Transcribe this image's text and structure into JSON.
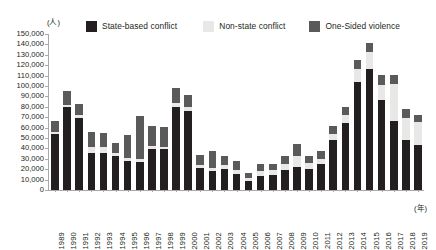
{
  "chart_data": {
    "type": "bar",
    "stacked": true,
    "title": "",
    "xlabel": "(年)",
    "ylabel": "(人)",
    "ylim": [
      0,
      150000
    ],
    "ytick_step": 10000,
    "grid": false,
    "legend_position": "top",
    "categories": [
      "1989",
      "1990",
      "1991",
      "1992",
      "1993",
      "1994",
      "1995",
      "1996",
      "1997",
      "1998",
      "1999",
      "2000",
      "2001",
      "2002",
      "2003",
      "2004",
      "2005",
      "2006",
      "2007",
      "2008",
      "2009",
      "2010",
      "2011",
      "2012",
      "2013",
      "2014",
      "2015",
      "2016",
      "2017",
      "2018",
      "2019"
    ],
    "ytick_labels": [
      "0",
      "10,000",
      "20,000",
      "30,000",
      "40,000",
      "50,000",
      "60,000",
      "70,000",
      "80,000",
      "90,000",
      "100,000",
      "110,000",
      "120,000",
      "130,000",
      "140,000",
      "150,000"
    ],
    "series": [
      {
        "name": "State-based conflict",
        "color": "#231f20",
        "values": [
          54000,
          80000,
          69000,
          36000,
          36000,
          33000,
          28000,
          27000,
          39000,
          39000,
          80000,
          76000,
          21000,
          18000,
          20000,
          15000,
          9000,
          13000,
          14000,
          19000,
          22000,
          20000,
          25000,
          48000,
          64000,
          104000,
          116000,
          87000,
          66000,
          48000,
          43000
        ]
      },
      {
        "name": "Non-state conflict",
        "color": "#e8e8e6",
        "values": [
          2000,
          2000,
          3000,
          5000,
          5000,
          3000,
          3000,
          3000,
          3000,
          2000,
          4000,
          4000,
          3000,
          3000,
          4000,
          4000,
          3000,
          5000,
          5000,
          6000,
          11000,
          6000,
          5000,
          6000,
          8000,
          12000,
          17000,
          14000,
          36000,
          21000,
          22000
        ]
      },
      {
        "name": "One-Sided violence",
        "color": "#5a5a5a",
        "values": [
          10000,
          13000,
          11000,
          15000,
          14000,
          9000,
          22000,
          41000,
          20000,
          20000,
          14000,
          11000,
          10000,
          17000,
          9000,
          9000,
          4000,
          7000,
          6000,
          8000,
          11000,
          7000,
          8000,
          8000,
          8000,
          9000,
          8000,
          10000,
          9000,
          9000,
          7000
        ]
      }
    ]
  },
  "legend": {
    "items": [
      {
        "label": "State-based conflict",
        "color": "#231f20"
      },
      {
        "label": "Non-state conflict",
        "color": "#e8e8e6"
      },
      {
        "label": "One-Sided violence",
        "color": "#5a5a5a"
      }
    ]
  },
  "axes": {
    "y_unit": "(人)",
    "x_unit": "(年)"
  }
}
